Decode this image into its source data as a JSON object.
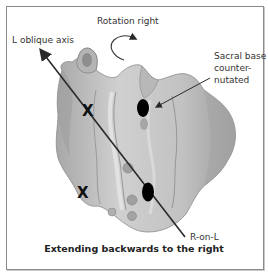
{
  "figure": {
    "labels": {
      "rotation": "Rotation right",
      "axis": "L oblique axis",
      "sacral_base_line1": "Sacral base",
      "sacral_base_line2": "counter-",
      "sacral_base_line3": "nutated",
      "r_on_l": "R-on-L"
    },
    "markers": {
      "x_upper": "X",
      "x_lower": "X"
    },
    "caption": "Extending backwards to the right",
    "colors": {
      "bone_fill": "#c4c4c4",
      "bone_shadow": "#9a9a9a",
      "bone_highlight": "#e2e2e2",
      "axis_line": "#2a2a2a",
      "dot": "#000000",
      "frame": "#8a8a8a"
    }
  }
}
